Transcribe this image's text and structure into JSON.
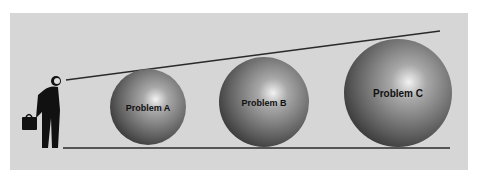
{
  "diagram": {
    "figure": "businessman-with-briefcase",
    "spheres": [
      {
        "label": "Problem A"
      },
      {
        "label": "Problem B"
      },
      {
        "label": "Problem C"
      }
    ],
    "colors": {
      "background": "#d6d6d6",
      "line": "#2a2a2a"
    }
  }
}
